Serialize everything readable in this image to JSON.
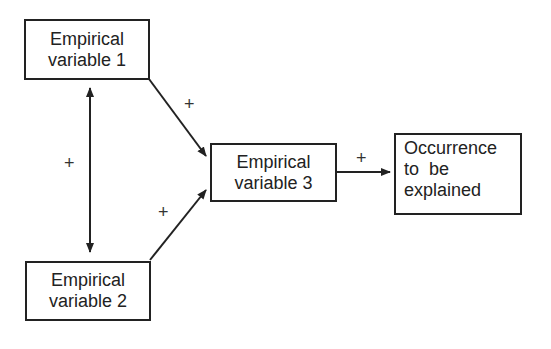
{
  "nodes": {
    "v1": {
      "line1": "Empirical",
      "line2": "variable 1"
    },
    "v2": {
      "line1": "Empirical",
      "line2": "variable 2"
    },
    "v3": {
      "line1": "Empirical",
      "line2": "variable 3"
    },
    "outcome": {
      "line1": "Occurrence",
      "line2": "to  be",
      "line3": "explained"
    }
  },
  "edges": [
    {
      "from": "v1",
      "to": "v2",
      "type": "bidirectional",
      "sign": "+"
    },
    {
      "from": "v1",
      "to": "v3",
      "type": "directed",
      "sign": "+"
    },
    {
      "from": "v2",
      "to": "v3",
      "type": "directed",
      "sign": "+"
    },
    {
      "from": "v3",
      "to": "outcome",
      "type": "directed",
      "sign": "+"
    }
  ],
  "signs": {
    "v1_v2": "+",
    "v1_v3": "+",
    "v2_v3": "+",
    "v3_out": "+"
  }
}
